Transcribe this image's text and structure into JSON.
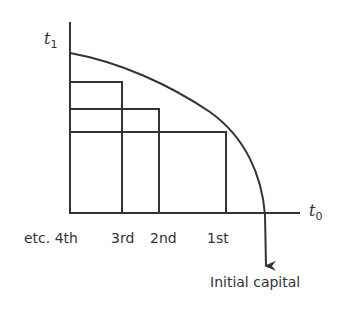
{
  "diagram": {
    "y_axis_label": "t",
    "y_axis_subscript": "1",
    "x_axis_label": "t",
    "x_axis_subscript": "0",
    "x_ticks": [
      "etc. 4th",
      "3rd",
      "2nd",
      "1st"
    ],
    "curve_label": "Initial capital",
    "colors": {
      "line": "#333333",
      "background": "#ffffff"
    }
  }
}
